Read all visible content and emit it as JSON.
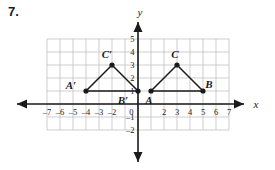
{
  "problem": {
    "number": "7."
  },
  "chart_data": {
    "type": "scatter",
    "title": "",
    "xlabel": "x",
    "ylabel": "y",
    "xlim": [
      -7,
      7
    ],
    "ylim": [
      -2,
      5
    ],
    "grid": true,
    "legend": "none",
    "x_ticks": [
      {
        "value": -7,
        "label": "–7"
      },
      {
        "value": -6,
        "label": "–6"
      },
      {
        "value": -5,
        "label": "–5"
      },
      {
        "value": -4,
        "label": "–4"
      },
      {
        "value": -3,
        "label": "–3"
      },
      {
        "value": -2,
        "label": "–2"
      },
      {
        "value": 2,
        "label": "2"
      },
      {
        "value": 3,
        "label": "3"
      },
      {
        "value": 4,
        "label": "4"
      },
      {
        "value": 5,
        "label": "5"
      },
      {
        "value": 6,
        "label": "6"
      },
      {
        "value": 7,
        "label": "7"
      }
    ],
    "y_ticks": [
      {
        "value": 5,
        "label": "5"
      },
      {
        "value": 4,
        "label": "4"
      },
      {
        "value": 3,
        "label": "3"
      },
      {
        "value": 2,
        "label": "2"
      },
      {
        "value": 1,
        "label": "1"
      },
      {
        "value": 0,
        "label": "0"
      },
      {
        "value": -1,
        "label": "–1"
      },
      {
        "value": -2,
        "label": "–2"
      }
    ],
    "series": [
      {
        "name": "Triangle ABC",
        "kind": "polygon",
        "points": [
          {
            "label": "A",
            "x": 1,
            "y": 1,
            "label_dx": -2,
            "label_dy": 13
          },
          {
            "label": "B",
            "x": 5,
            "y": 1,
            "label_dx": 6,
            "label_dy": -3
          },
          {
            "label": "C",
            "x": 3,
            "y": 3,
            "label_dx": -2,
            "label_dy": -7
          }
        ]
      },
      {
        "name": "Triangle A'B'C' (image)",
        "kind": "polygon",
        "points": [
          {
            "label": "A′",
            "x": -4,
            "y": 1,
            "label_dx": -15,
            "label_dy": -2
          },
          {
            "label": "B′",
            "x": 0,
            "y": 1,
            "label_dx": -15,
            "label_dy": 13
          },
          {
            "label": "C′",
            "x": -2,
            "y": 3,
            "label_dx": -5,
            "label_dy": -7
          }
        ]
      }
    ],
    "colors": {
      "ink": "#1a1a1a",
      "grid": "#b9b9bd",
      "background": "#ffffff"
    }
  }
}
